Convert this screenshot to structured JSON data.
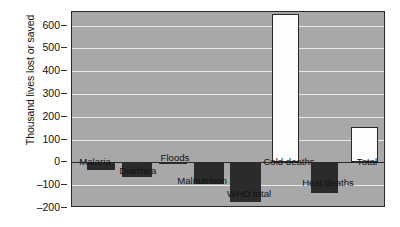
{
  "chart_data": {
    "type": "bar",
    "title": "",
    "subtitle": "",
    "xlabel": "",
    "ylabel": "Thousand lives lost or saved",
    "ylim": [
      -200,
      660
    ],
    "ytick_values": [
      600,
      500,
      400,
      300,
      200,
      100,
      0,
      -100,
      -200
    ],
    "ytick_labels": [
      "600",
      "500",
      "400",
      "300",
      "200",
      "100",
      "0",
      "–100",
      "–200"
    ],
    "grid": "horizontal",
    "legend": "none",
    "categories": [
      "Malaria",
      "Diarrhea",
      "Floods",
      "Malnutrition",
      "WHO total",
      "Cold deaths",
      "Heat deaths",
      "Total"
    ],
    "values": [
      -35,
      -65,
      -5,
      -95,
      -175,
      650,
      -135,
      155
    ],
    "bar_colors": [
      "#2b2b2b",
      "#2b2b2b",
      "#2b2b2b",
      "#2b2b2b",
      "#2b2b2b",
      "#fdfdfd",
      "#2b2b2b",
      "#fdfdfd"
    ],
    "plot_background": "#a8a8a8",
    "gridline_color": "#e9e9e9",
    "axis_color": "#2a2a2a",
    "bars": [
      {
        "label": "Malaria",
        "value": -35,
        "x_center": 28.5,
        "width": 28,
        "sign": "neg",
        "label_dx": 23,
        "label_y": 156
      },
      {
        "label": "Diarrhea",
        "value": -65,
        "x_center": 64.5,
        "width": 30,
        "sign": "neg",
        "label_dx": 66,
        "label_y": 165
      },
      {
        "label": "Floods",
        "value": -5,
        "x_center": 100.5,
        "width": 28,
        "sign": "neg",
        "label_dx": 103,
        "label_y": 152
      },
      {
        "label": "Malnutrition",
        "value": -95,
        "x_center": 136.5,
        "width": 30,
        "sign": "neg",
        "label_dx": 130,
        "label_y": 175
      },
      {
        "label": "WHO total",
        "value": -175,
        "x_center": 173.5,
        "width": 31,
        "sign": "neg",
        "label_dx": 177,
        "label_y": 188
      },
      {
        "label": "Cold deaths",
        "value": 650,
        "x_center": 213.5,
        "width": 27,
        "sign": "pos",
        "label_dx": 217,
        "label_y": 156
      },
      {
        "label": "Heat deaths",
        "value": -135,
        "x_center": 252.5,
        "width": 27,
        "sign": "neg",
        "label_dx": 256,
        "label_y": 177
      },
      {
        "label": "Total",
        "value": 155,
        "x_center": 292.5,
        "width": 27,
        "sign": "pos",
        "label_dx": 295,
        "label_y": 156
      }
    ]
  }
}
